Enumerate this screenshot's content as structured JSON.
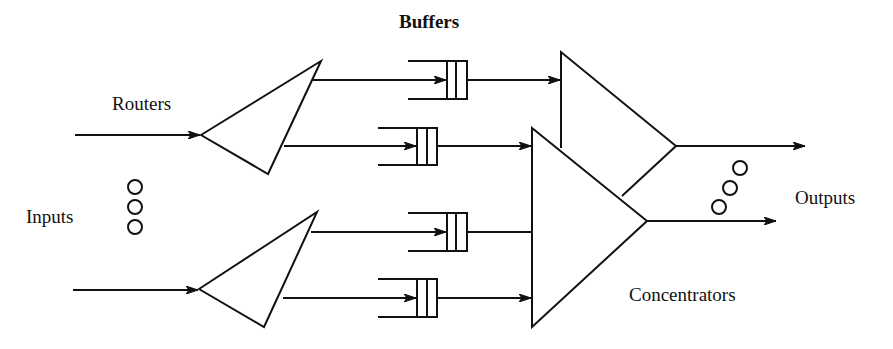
{
  "diagram": {
    "type": "network-switch-architecture",
    "labels": {
      "buffers": "Buffers",
      "routers": "Routers",
      "inputs": "Inputs",
      "outputs": "Outputs",
      "concentrators": "Concentrators"
    },
    "components": {
      "routers": [
        {
          "id": "router-1",
          "inputs": 1,
          "outputs": 2
        },
        {
          "id": "router-2",
          "inputs": 1,
          "outputs": 2
        }
      ],
      "buffers": [
        {
          "id": "buffer-1",
          "from": "router-1",
          "to": "concentrator-1"
        },
        {
          "id": "buffer-2",
          "from": "router-1",
          "to": "concentrator-2"
        },
        {
          "id": "buffer-3",
          "from": "router-2",
          "to": "concentrator-2"
        },
        {
          "id": "buffer-4",
          "from": "router-2",
          "to": "concentrator-2"
        }
      ],
      "concentrators": [
        {
          "id": "concentrator-1",
          "outputs": 1
        },
        {
          "id": "concentrator-2",
          "outputs": 1
        }
      ]
    },
    "ellipsis_markers": [
      {
        "id": "inputs-ellipsis",
        "orientation": "vertical",
        "count": 3
      },
      {
        "id": "outputs-ellipsis",
        "orientation": "diagonal",
        "count": 3
      }
    ],
    "colors": {
      "stroke": "#111111",
      "background": "#ffffff"
    }
  }
}
